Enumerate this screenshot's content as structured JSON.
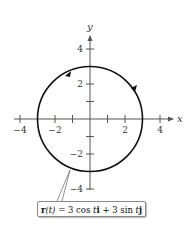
{
  "diagram": {
    "type": "parametric-curve-plot",
    "curve": "circle",
    "center": [
      0,
      0
    ],
    "radius": 3,
    "orientation": "counterclockwise",
    "x_axis": {
      "label": "x",
      "range": [
        -4,
        4
      ],
      "ticks": [
        -4,
        -3,
        -2,
        -1,
        1,
        2,
        3,
        4
      ],
      "tick_labels": [
        "-4",
        "-2",
        "2",
        "4"
      ]
    },
    "y_axis": {
      "label": "y",
      "range": [
        -4,
        4
      ],
      "ticks": [
        -4,
        -3,
        -2,
        -1,
        1,
        2,
        3,
        4
      ],
      "tick_labels": [
        "4",
        "2",
        "-2",
        "-4"
      ]
    },
    "equation_label": "r(t) = 3 cos t i + 3 sin t j",
    "colors": {
      "curve": "#111111",
      "axes": "#555555",
      "text": "#333333"
    }
  },
  "labels": {
    "x_axis": "x",
    "y_axis": "y",
    "x_tick_neg4": "−4",
    "x_tick_neg2": "−2",
    "x_tick_2": "2",
    "x_tick_4": "4",
    "y_tick_4": "4",
    "y_tick_2": "2",
    "y_tick_neg2": "−2",
    "y_tick_neg4": "−4"
  },
  "equation": {
    "r": "r",
    "t_arg": "(t)",
    "rest1": " = 3 cos ",
    "t1": "t",
    "i": "i",
    "rest2": " + 3 sin ",
    "t2": "t",
    "j": "j"
  }
}
